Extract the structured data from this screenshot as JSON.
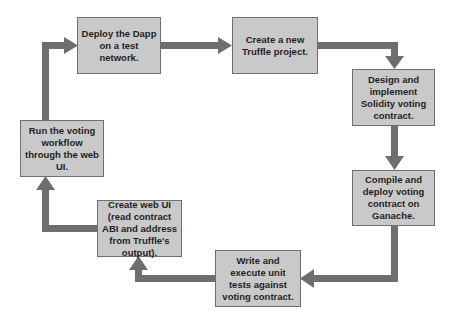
{
  "diagram": {
    "type": "cycle-flowchart",
    "colors": {
      "box_fill": "#c9c9c9",
      "box_border": "#6f6f6f",
      "arrow": "#6e6e6e",
      "text": "#1f1f1f",
      "background": "#ffffff"
    },
    "steps": [
      {
        "id": "deploy",
        "label": "Deploy the Dapp on a test network."
      },
      {
        "id": "create-truffle",
        "label": "Create a new Truffle project."
      },
      {
        "id": "design",
        "label": "Design and implement Solidity voting contract."
      },
      {
        "id": "compile",
        "label": "Compile and deploy voting contract on Ganache."
      },
      {
        "id": "tests",
        "label": "Write and execute unit tests against voting contract."
      },
      {
        "id": "web-ui",
        "label": "Create web UI (read contract ABI and address from Truffle's output)."
      },
      {
        "id": "run",
        "label": "Run the voting workflow through the web UI."
      }
    ],
    "edges": [
      {
        "from": "deploy",
        "to": "create-truffle"
      },
      {
        "from": "create-truffle",
        "to": "design"
      },
      {
        "from": "design",
        "to": "compile"
      },
      {
        "from": "compile",
        "to": "tests"
      },
      {
        "from": "tests",
        "to": "web-ui"
      },
      {
        "from": "web-ui",
        "to": "run"
      },
      {
        "from": "run",
        "to": "deploy"
      }
    ]
  }
}
